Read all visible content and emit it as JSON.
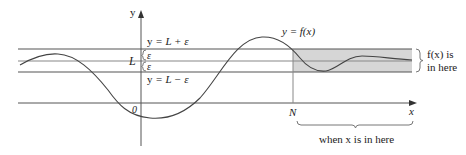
{
  "diagram": {
    "colors": {
      "band_fill": "#d6d6d6",
      "line": "#555555",
      "curve": "#444444",
      "text": "#222222"
    },
    "labels": {
      "y_axis": "y",
      "x_axis": "x",
      "origin": "0",
      "L": "L",
      "eps_upper": "ε",
      "eps_lower": "ε",
      "upper_line": "y = L + ε",
      "upper_line_y": "y",
      "upper_line_rest": " = L + ε",
      "lower_line_y": "y",
      "lower_line_rest": " = L − ε",
      "curve_label": "y = f(x)",
      "N": "N",
      "band_note_line1": "f(x) is",
      "band_note_line2": "in here",
      "x_note": "when x is in here"
    }
  }
}
